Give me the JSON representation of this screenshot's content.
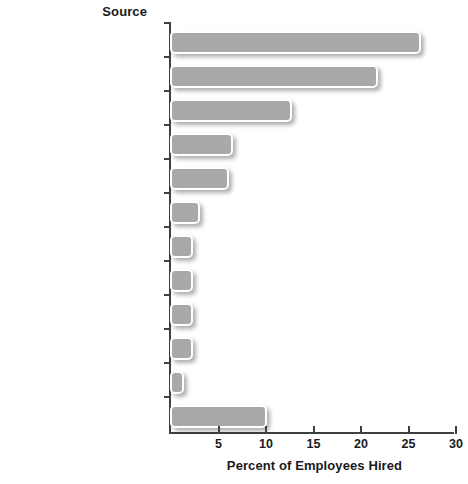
{
  "chart_data": {
    "type": "bar",
    "orientation": "horizontal",
    "title": "",
    "ylabel": "Source",
    "xlabel": "Percent of Employees Hired",
    "xlim": [
      0,
      30
    ],
    "xticks": [
      5,
      10,
      15,
      20,
      25,
      30
    ],
    "grid": false,
    "legend": null,
    "bar_color": "#a9a9a9",
    "axis_color": "#404040",
    "categories": [
      "Referrals",
      "Company Web site",
      "Job boards",
      "Direct sourcing*",
      "College recruiting",
      "Rehiring former employees",
      "Print/media ads",
      "Walk-ins",
      "Employment agencies",
      "Career fairs",
      "Hiring temporary employees\nas permanent",
      "Other sources"
    ],
    "values": [
      26.4,
      21.9,
      12.8,
      6.6,
      6.2,
      3.2,
      2.4,
      2.4,
      2.4,
      2.4,
      1.5,
      10.2
    ]
  }
}
